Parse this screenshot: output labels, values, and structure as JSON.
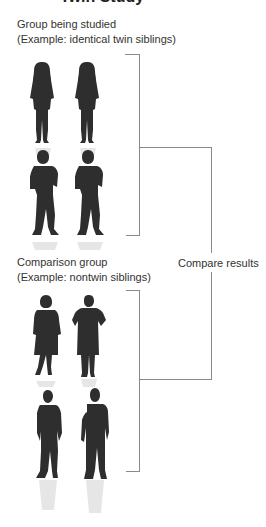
{
  "title": {
    "text": "Twin Study"
  },
  "groups": [
    {
      "heading": "Group being studied",
      "example": "(Example: identical twin siblings)"
    },
    {
      "heading": "Comparison group",
      "example": "(Example: nontwin siblings)"
    }
  ],
  "result": {
    "label": "Compare results"
  },
  "colors": {
    "text": "#333333",
    "line": "#8a8a8a",
    "silhouette": "#2e2e2e"
  }
}
